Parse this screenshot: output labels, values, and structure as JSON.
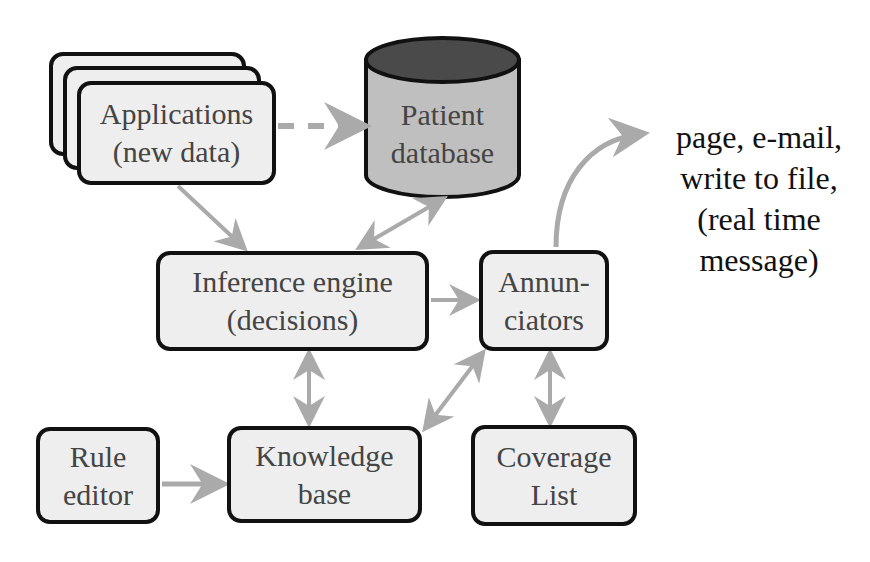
{
  "diagram": {
    "nodes": {
      "applications": {
        "line1": "Applications",
        "line2": "(new data)"
      },
      "patient_database": {
        "line1": "Patient",
        "line2": "database"
      },
      "inference_engine": {
        "line1": "Inference engine",
        "line2": "(decisions)"
      },
      "annunciators": {
        "line1": "Annun-",
        "line2": "ciators"
      },
      "rule_editor": {
        "line1": "Rule",
        "line2": "editor"
      },
      "knowledge_base": {
        "line1": "Knowledge",
        "line2": "base"
      },
      "coverage_list": {
        "line1": "Coverage",
        "line2": "List"
      }
    },
    "outputs": {
      "line1": "page, e-mail,",
      "line2": "write to file,",
      "line3": "(real time",
      "line4": "message)"
    },
    "edges": [
      {
        "from": "applications",
        "to": "patient_database",
        "style": "dashed",
        "direction": "forward"
      },
      {
        "from": "applications",
        "to": "inference_engine",
        "style": "solid",
        "direction": "forward"
      },
      {
        "from": "inference_engine",
        "to": "patient_database",
        "style": "solid",
        "direction": "both"
      },
      {
        "from": "inference_engine",
        "to": "annunciators",
        "style": "solid",
        "direction": "forward"
      },
      {
        "from": "inference_engine",
        "to": "knowledge_base",
        "style": "solid",
        "direction": "both"
      },
      {
        "from": "annunciators",
        "to": "knowledge_base",
        "style": "solid",
        "direction": "both"
      },
      {
        "from": "annunciators",
        "to": "coverage_list",
        "style": "solid",
        "direction": "both"
      },
      {
        "from": "rule_editor",
        "to": "knowledge_base",
        "style": "solid",
        "direction": "forward"
      },
      {
        "from": "annunciators",
        "to": "outputs",
        "style": "curved",
        "direction": "forward"
      }
    ],
    "colors": {
      "node_fill": "#eeeeee",
      "node_border": "#111111",
      "node_text": "#444444",
      "arrow": "#aaaaaa",
      "db_body": "#bfbfbf",
      "db_top": "#4a4a4a",
      "output_text": "#111111"
    }
  }
}
